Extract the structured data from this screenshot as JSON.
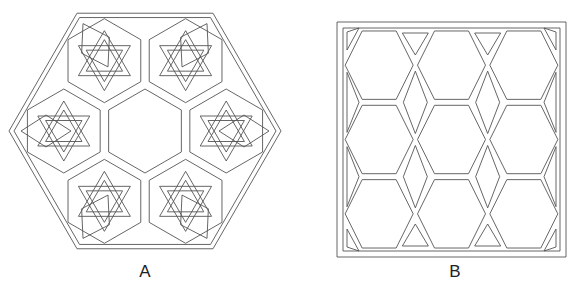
{
  "figures": [
    {
      "id": "A",
      "label": "A",
      "description": "Large flat-top hexagonal frame containing seven hexagonal openings (center plain, six surrounding ones each holding an interlaced six-pointed star) with rhombic openings between them",
      "center": [
        145,
        131
      ],
      "outer_radius": 136,
      "stars": 6,
      "rhombi": 6
    },
    {
      "id": "B",
      "label": "B",
      "description": "Square frame filled with a lattice of hexagonal openings (3x3) with rhombic and triangular openings between them",
      "bounds": [
        337,
        22,
        566,
        257
      ],
      "hexagons": 9
    }
  ],
  "colors": {
    "line": "#555555",
    "background": "#ffffff"
  }
}
